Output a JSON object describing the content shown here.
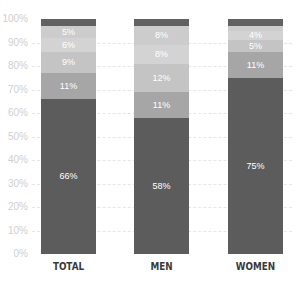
{
  "chart_data": {
    "type": "bar",
    "stacked": true,
    "title": "",
    "xlabel": "",
    "ylabel": "",
    "ylim": [
      0,
      100
    ],
    "yticks": [
      "0%",
      "10%",
      "20%",
      "30%",
      "40%",
      "50%",
      "60%",
      "70%",
      "80%",
      "90%",
      "100%"
    ],
    "grid": true,
    "categories": [
      "TOTAL",
      "MEN",
      "WOMEN"
    ],
    "series": [
      {
        "name": "segment-1",
        "color": "#5c5c5c",
        "values": [
          66,
          58,
          75
        ],
        "labels": [
          "66%",
          "58%",
          "75%"
        ]
      },
      {
        "name": "segment-2",
        "color": "#a6a6a6",
        "values": [
          11,
          11,
          11
        ],
        "labels": [
          "11%",
          "11%",
          "11%"
        ]
      },
      {
        "name": "segment-3",
        "color": "#c4c4c4",
        "values": [
          9,
          12,
          5
        ],
        "labels": [
          "9%",
          "12%",
          "5%"
        ]
      },
      {
        "name": "segment-4",
        "color": "#d3d3d3",
        "values": [
          6,
          8,
          4
        ],
        "labels": [
          "6%",
          "8%",
          "4%"
        ]
      },
      {
        "name": "segment-5",
        "color": "#cccccc",
        "values": [
          5,
          8,
          2
        ],
        "labels": [
          "5%",
          "8%",
          ""
        ]
      },
      {
        "name": "segment-6",
        "color": "#616161",
        "values": [
          3,
          3,
          3
        ],
        "labels": [
          "",
          "",
          ""
        ]
      }
    ]
  }
}
